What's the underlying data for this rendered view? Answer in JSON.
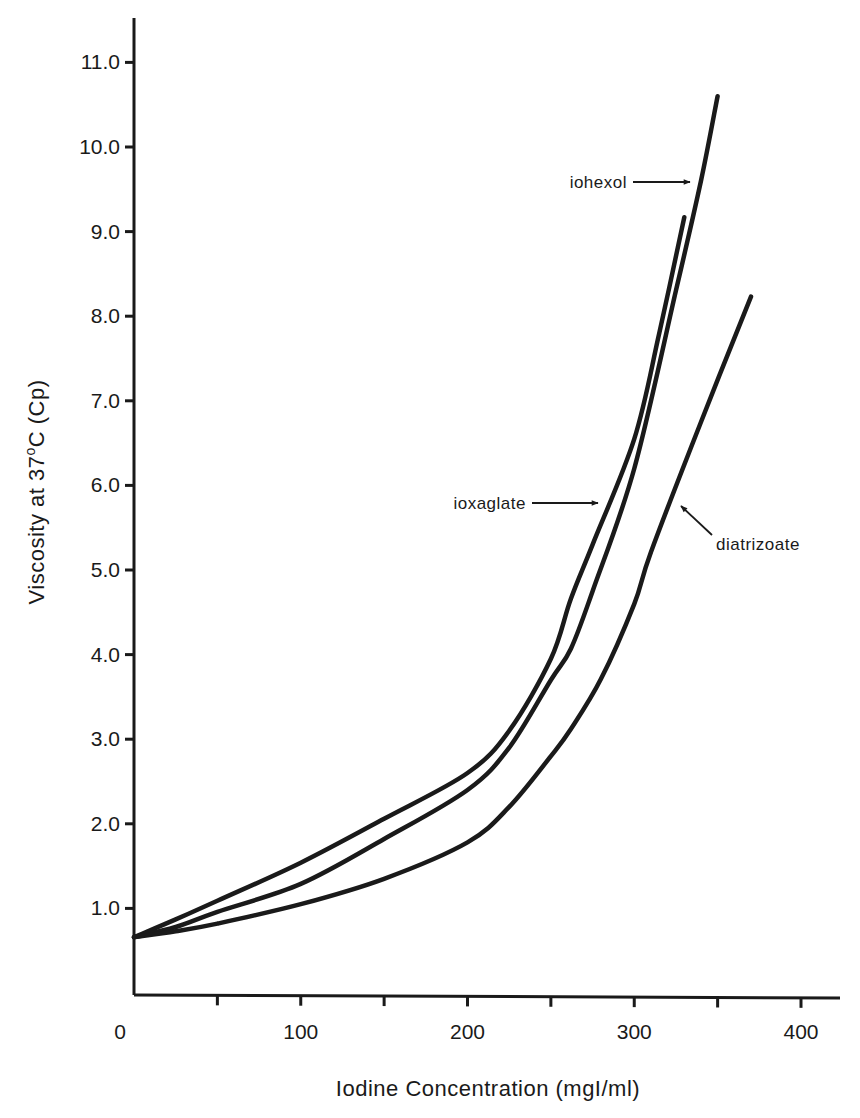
{
  "chart_data": {
    "type": "line",
    "title": "",
    "xlabel": "Iodine Concentration (mgI/ml)",
    "ylabel_parts": {
      "pre": "Viscosity at 37",
      "sup": "o",
      "post": "C (Cp)"
    },
    "ylabel": "Viscosity at 37°C (Cp)",
    "xlim": [
      0,
      420
    ],
    "ylim": [
      0,
      11.5
    ],
    "xticks": [
      0,
      50,
      100,
      150,
      200,
      250,
      300,
      350,
      400
    ],
    "xtick_labels": [
      {
        "value": 0,
        "label": "0"
      },
      {
        "value": 100,
        "label": "100"
      },
      {
        "value": 200,
        "label": "200"
      },
      {
        "value": 300,
        "label": "300"
      },
      {
        "value": 400,
        "label": "400"
      }
    ],
    "yticks": [
      {
        "value": 1,
        "label": "1.0"
      },
      {
        "value": 2,
        "label": "2.0"
      },
      {
        "value": 3,
        "label": "3.0"
      },
      {
        "value": 4,
        "label": "4.0"
      },
      {
        "value": 5,
        "label": "5.0"
      },
      {
        "value": 6,
        "label": "6.0"
      },
      {
        "value": 7,
        "label": "7.0"
      },
      {
        "value": 8,
        "label": "8.0"
      },
      {
        "value": 9,
        "label": "9.0"
      },
      {
        "value": 10,
        "label": "10.0"
      },
      {
        "value": 11,
        "label": "11.0"
      }
    ],
    "grid": false,
    "legend": "none (inline arrow annotations)",
    "series": [
      {
        "name": "ioxaglate",
        "x": [
          0,
          25,
          50,
          100,
          150,
          200,
          225,
          250,
          262,
          275,
          300,
          315,
          330
        ],
        "y": [
          0.66,
          0.87,
          1.09,
          1.54,
          2.06,
          2.6,
          3.1,
          3.95,
          4.66,
          5.3,
          6.55,
          7.8,
          9.17
        ]
      },
      {
        "name": "iohexol",
        "x": [
          0,
          25,
          50,
          100,
          150,
          200,
          225,
          250,
          262,
          275,
          300,
          325,
          340,
          350
        ],
        "y": [
          0.66,
          0.78,
          0.96,
          1.29,
          1.82,
          2.4,
          2.9,
          3.7,
          4.07,
          4.75,
          6.2,
          8.3,
          9.6,
          10.6
        ]
      },
      {
        "name": "diatrizoate",
        "x": [
          0,
          25,
          50,
          100,
          150,
          200,
          225,
          250,
          262,
          280,
          300,
          310,
          340,
          370
        ],
        "y": [
          0.66,
          0.73,
          0.82,
          1.05,
          1.35,
          1.78,
          2.2,
          2.8,
          3.12,
          3.71,
          4.6,
          5.21,
          6.75,
          8.23
        ]
      }
    ],
    "annotations": [
      {
        "text": "iohexol",
        "points_to": "iohexol",
        "at": {
          "x": 337,
          "y": 9.6
        }
      },
      {
        "text": "ioxaglate",
        "points_to": "ioxaglate",
        "at": {
          "x": 280,
          "y": 5.85
        }
      },
      {
        "text": "diatrizoate",
        "points_to": "diatrizoate",
        "at": {
          "x": 328,
          "y": 5.77
        }
      }
    ]
  }
}
